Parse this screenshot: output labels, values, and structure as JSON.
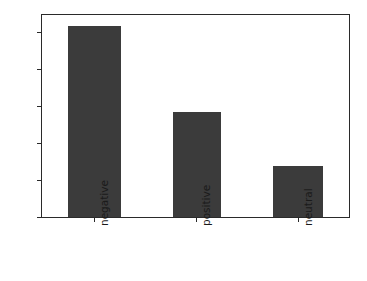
{
  "chart_data": {
    "type": "bar",
    "title": "",
    "xlabel": "",
    "ylabel": "",
    "categories": [
      "negative",
      "positive",
      "neutral"
    ],
    "values": [
      516,
      284,
      137
    ],
    "series": [
      {
        "name": "count",
        "values": [
          516,
          284,
          137
        ]
      }
    ],
    "ylim": [
      0,
      546
    ],
    "yticks": [
      0,
      100,
      200,
      300,
      400,
      500
    ],
    "ytick_labels": [
      "0",
      "100",
      "200",
      "300",
      "400",
      "500"
    ],
    "xtick_labels": [
      "negative",
      "positive",
      "neutral"
    ],
    "xtick_rotation": 90,
    "grid": false,
    "legend": null,
    "bar_color": "#3b3b3b",
    "axes_color": "#2a2a2a",
    "background": "#ffffff"
  },
  "figure": {
    "width": 367,
    "height": 281
  }
}
